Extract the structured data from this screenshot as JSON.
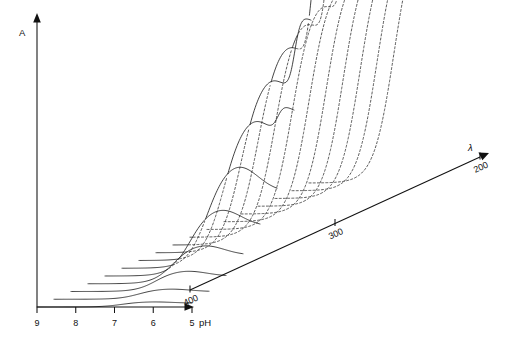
{
  "figure": {
    "kind": "three-dimensional-waterfall-spectra",
    "background_color": "#ffffff",
    "line_color": "#1a1a1a",
    "width": 510,
    "height": 343
  },
  "axes": {
    "vertical": {
      "label": "A",
      "name": "absorbance-axis",
      "has_arrow": true,
      "ticks": []
    },
    "horizontal": {
      "label": "pH",
      "name": "ph-axis",
      "has_arrow": true,
      "ticks": [
        "9",
        "8",
        "7",
        "6",
        "5"
      ],
      "tick_values": [
        9,
        8,
        7,
        6,
        5
      ],
      "direction": "decreasing-left-to-right"
    },
    "depth": {
      "label": "λ",
      "name": "wavelength-axis",
      "has_arrow": true,
      "ticks": [
        "400",
        "300",
        "200"
      ],
      "tick_values": [
        400,
        300,
        200
      ],
      "unit": "nm",
      "direction": "decreasing-front-to-back"
    }
  },
  "chart_data": {
    "type": "line",
    "title": "",
    "subtitle": "",
    "xlabel": "pH",
    "ylabel": "A",
    "zlabel": "λ",
    "grid": false,
    "legend_position": "none",
    "projection": "oblique-3d-waterfall",
    "xlim": [
      9,
      5
    ],
    "zlim": [
      400,
      200
    ],
    "ylim": [
      0,
      1
    ],
    "x_ticklabels": [
      "9",
      "8",
      "7",
      "6",
      "5"
    ],
    "z_ticklabels": [
      "400",
      "300",
      "200"
    ],
    "annotations": [
      "Curves that are occluded by nearer traces are drawn as dashed segments.",
      "Traces at the shortest wavelengths rise beyond the top of the absorbance axis."
    ],
    "x": [
      9.0,
      8.75,
      8.5,
      8.25,
      8.0,
      7.75,
      7.5,
      7.25,
      7.0,
      6.75,
      6.5,
      6.25,
      6.0,
      5.75,
      5.5,
      5.25,
      5.0
    ],
    "series": [
      {
        "name": "λ = 400 nm",
        "z": 400,
        "peak_ph": 6.0,
        "peak_amplitude": 0.02,
        "values": [
          0.0,
          0.0,
          0.001,
          0.001,
          0.002,
          0.003,
          0.005,
          0.008,
          0.011,
          0.015,
          0.018,
          0.02,
          0.02,
          0.019,
          0.017,
          0.015,
          0.013
        ]
      },
      {
        "name": "λ = 387 nm",
        "z": 387,
        "peak_ph": 6.0,
        "peak_amplitude": 0.04,
        "values": [
          0.0,
          0.001,
          0.001,
          0.002,
          0.004,
          0.007,
          0.011,
          0.017,
          0.023,
          0.03,
          0.036,
          0.04,
          0.04,
          0.038,
          0.034,
          0.03,
          0.026
        ]
      },
      {
        "name": "λ = 375 nm",
        "z": 375,
        "peak_ph": 6.0,
        "peak_amplitude": 0.08,
        "values": [
          0.0,
          0.001,
          0.003,
          0.005,
          0.009,
          0.015,
          0.023,
          0.034,
          0.046,
          0.06,
          0.072,
          0.08,
          0.08,
          0.076,
          0.068,
          0.06,
          0.052
        ]
      },
      {
        "name": "λ = 362 nm",
        "z": 362,
        "peak_ph": 6.0,
        "peak_amplitude": 0.15,
        "values": [
          0.001,
          0.002,
          0.005,
          0.01,
          0.018,
          0.029,
          0.044,
          0.064,
          0.087,
          0.112,
          0.135,
          0.15,
          0.15,
          0.143,
          0.128,
          0.113,
          0.098
        ]
      },
      {
        "name": "λ = 350 nm",
        "z": 350,
        "peak_ph": 6.0,
        "peak_amplitude": 0.26,
        "values": [
          0.002,
          0.004,
          0.009,
          0.018,
          0.031,
          0.05,
          0.076,
          0.111,
          0.151,
          0.194,
          0.234,
          0.26,
          0.26,
          0.248,
          0.222,
          0.196,
          0.17
        ]
      },
      {
        "name": "λ = 337 nm",
        "z": 337,
        "peak_ph": 6.0,
        "peak_amplitude": 0.4,
        "values": [
          0.003,
          0.006,
          0.014,
          0.028,
          0.048,
          0.077,
          0.117,
          0.171,
          0.232,
          0.298,
          0.36,
          0.4,
          0.4,
          0.381,
          0.341,
          0.301,
          0.261
        ]
      },
      {
        "name": "λ = 325 nm",
        "z": 325,
        "peak_ph": 6.0,
        "peak_amplitude": 0.55,
        "values": [
          0.004,
          0.009,
          0.019,
          0.038,
          0.066,
          0.106,
          0.161,
          0.235,
          0.319,
          0.41,
          0.495,
          0.55,
          0.55,
          0.524,
          0.469,
          0.414,
          0.359
        ]
      },
      {
        "name": "λ = 312 nm",
        "z": 312,
        "peak_ph": 6.0,
        "peak_amplitude": 0.68,
        "values": [
          0.005,
          0.011,
          0.024,
          0.047,
          0.082,
          0.131,
          0.199,
          0.291,
          0.395,
          0.507,
          0.612,
          0.68,
          0.68,
          0.648,
          0.58,
          0.512,
          0.444
        ]
      },
      {
        "name": "λ = 300 nm",
        "z": 300,
        "peak_ph": 6.0,
        "peak_amplitude": 0.78,
        "values": [
          0.006,
          0.013,
          0.027,
          0.054,
          0.094,
          0.15,
          0.228,
          0.333,
          0.453,
          0.581,
          0.702,
          0.78,
          0.78,
          0.743,
          0.665,
          0.587,
          0.509
        ]
      },
      {
        "name": "λ = 287 nm",
        "z": 287,
        "peak_ph": 6.0,
        "peak_amplitude": 0.84,
        "values": [
          0.006,
          0.014,
          0.029,
          0.058,
          0.101,
          0.162,
          0.246,
          0.359,
          0.488,
          0.626,
          0.756,
          0.84,
          0.84,
          0.8,
          0.716,
          0.632,
          0.548
        ]
      },
      {
        "name": "λ = 275 nm",
        "z": 275,
        "peak_ph": 6.0,
        "peak_amplitude": 0.88,
        "values": [
          0.007,
          0.015,
          0.031,
          0.061,
          0.106,
          0.169,
          0.257,
          0.376,
          0.511,
          0.656,
          0.792,
          0.88,
          0.88,
          0.838,
          0.75,
          0.662,
          0.574
        ]
      },
      {
        "name": "λ = 262 nm",
        "z": 262,
        "peak_ph": 6.0,
        "peak_amplitude": 0.91,
        "values": [
          0.007,
          0.015,
          0.032,
          0.063,
          0.11,
          0.175,
          0.266,
          0.389,
          0.528,
          0.678,
          0.819,
          0.91,
          0.91,
          0.867,
          0.775,
          0.684,
          0.594
        ]
      },
      {
        "name": "λ = 250 nm",
        "z": 250,
        "peak_ph": 6.0,
        "peak_amplitude": 0.93,
        "values": [
          0.007,
          0.016,
          0.033,
          0.065,
          0.112,
          0.179,
          0.272,
          0.397,
          0.54,
          0.693,
          0.837,
          0.93,
          0.93,
          0.886,
          0.792,
          0.699,
          0.606
        ]
      },
      {
        "name": "λ = 237 nm",
        "z": 237,
        "peak_ph": 6.0,
        "peak_amplitude": 0.95,
        "values": [
          0.007,
          0.016,
          0.033,
          0.066,
          0.115,
          0.183,
          0.278,
          0.406,
          0.552,
          0.708,
          0.855,
          0.95,
          0.95,
          0.905,
          0.809,
          0.714,
          0.619
        ]
      },
      {
        "name": "λ = 225 nm",
        "z": 225,
        "peak_ph": 6.0,
        "peak_amplitude": 0.96,
        "values": [
          0.008,
          0.016,
          0.034,
          0.067,
          0.116,
          0.185,
          0.281,
          0.41,
          0.558,
          0.716,
          0.864,
          0.96,
          0.96,
          0.915,
          0.818,
          0.722,
          0.626
        ]
      },
      {
        "name": "λ = 212 nm",
        "z": 212,
        "peak_ph": 6.0,
        "peak_amplitude": 0.97,
        "values": [
          0.008,
          0.017,
          0.034,
          0.068,
          0.117,
          0.187,
          0.284,
          0.414,
          0.563,
          0.723,
          0.873,
          0.97,
          0.97,
          0.924,
          0.826,
          0.729,
          0.632
        ]
      },
      {
        "name": "λ = 200 nm",
        "z": 200,
        "peak_ph": 6.0,
        "peak_amplitude": 0.98,
        "values": [
          0.008,
          0.017,
          0.035,
          0.068,
          0.119,
          0.189,
          0.287,
          0.418,
          0.569,
          0.73,
          0.882,
          0.98,
          0.98,
          0.933,
          0.835,
          0.736,
          0.638
        ]
      }
    ],
    "series_count": 17
  }
}
